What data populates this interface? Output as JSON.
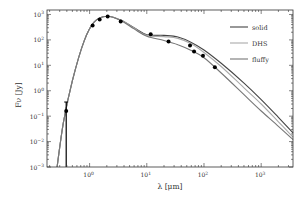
{
  "chart_data": {
    "type": "line",
    "title": "",
    "xlabel": "λ [μm]",
    "ylabel": "F_ν [Jy]",
    "xscale": "log",
    "yscale": "log",
    "xlim": [
      0.18,
      3600
    ],
    "ylim": [
      0.001,
      1500
    ],
    "grid": false,
    "legend_position": "upper right",
    "x_ticks": [
      {
        "value": 1,
        "label": "10^0"
      },
      {
        "value": 10,
        "label": "10^1"
      },
      {
        "value": 100,
        "label": "10^2"
      },
      {
        "value": 1000,
        "label": "10^3"
      }
    ],
    "y_ticks": [
      {
        "value": 0.001,
        "label": "10^-3"
      },
      {
        "value": 0.01,
        "label": "10^-2"
      },
      {
        "value": 0.1,
        "label": "10^-1"
      },
      {
        "value": 1,
        "label": "10^0"
      },
      {
        "value": 10,
        "label": "10^1"
      },
      {
        "value": 100,
        "label": "10^2"
      },
      {
        "value": 1000,
        "label": "10^3"
      }
    ],
    "series": [
      {
        "name": "solid",
        "color": "#444444",
        "x": [
          0.27,
          0.35,
          0.5,
          0.8,
          1.2,
          2.0,
          3.5,
          6,
          10,
          20,
          35,
          60,
          100,
          200,
          500,
          1000,
          2000,
          3600
        ],
        "y": [
          0.001,
          0.06,
          2.5,
          90,
          500,
          850,
          600,
          300,
          160,
          150,
          130,
          80,
          40,
          12,
          2.0,
          0.45,
          0.09,
          0.022
        ]
      },
      {
        "name": "DHS",
        "color": "#aaaaaa",
        "x": [
          0.27,
          0.35,
          0.5,
          0.8,
          1.2,
          2.0,
          3.5,
          6,
          10,
          20,
          35,
          60,
          100,
          200,
          500,
          1000,
          2000,
          3600
        ],
        "y": [
          0.001,
          0.06,
          2.5,
          90,
          500,
          850,
          600,
          290,
          150,
          135,
          115,
          70,
          32,
          9,
          1.3,
          0.3,
          0.06,
          0.015
        ]
      },
      {
        "name": "fluffy",
        "color": "#777777",
        "x": [
          0.27,
          0.35,
          0.5,
          0.8,
          1.2,
          2.0,
          3.5,
          6,
          10,
          20,
          35,
          60,
          100,
          200,
          500,
          1000,
          2000,
          3600
        ],
        "y": [
          0.001,
          0.06,
          2.5,
          90,
          500,
          850,
          580,
          270,
          140,
          95,
          65,
          38,
          20,
          5,
          0.7,
          0.16,
          0.04,
          0.012
        ]
      }
    ],
    "observations": {
      "name": "photometry",
      "color": "#000000",
      "points": [
        {
          "x": 0.39,
          "y": 0.16,
          "err_low": 0.159,
          "err_high": 0.2
        },
        {
          "x": 1.13,
          "y": 370
        },
        {
          "x": 1.5,
          "y": 640
        },
        {
          "x": 2.07,
          "y": 840
        },
        {
          "x": 3.5,
          "y": 530
        },
        {
          "x": 11.7,
          "y": 165
        },
        {
          "x": 24,
          "y": 86
        },
        {
          "x": 57,
          "y": 60
        },
        {
          "x": 67,
          "y": 35
        },
        {
          "x": 96,
          "y": 24
        },
        {
          "x": 155,
          "y": 8.3
        }
      ]
    }
  },
  "legend": {
    "items": [
      {
        "label": "solid",
        "color": "#444444"
      },
      {
        "label": "DHS",
        "color": "#aaaaaa"
      },
      {
        "label": "fluffy",
        "color": "#777777"
      }
    ]
  },
  "axes": {
    "xlabel_text": "λ [μm]",
    "ylabel_text": "Fν [Jy]"
  }
}
